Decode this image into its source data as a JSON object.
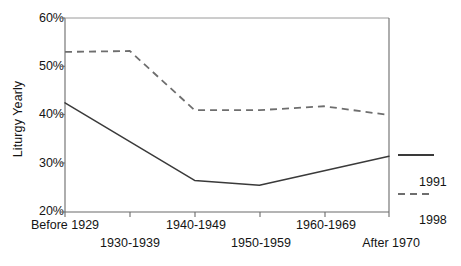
{
  "chart_data": {
    "type": "line",
    "title": "",
    "xlabel": "",
    "ylabel": "Liturgy Yearly",
    "categories": [
      "Before 1929",
      "1930-1939",
      "1940-1949",
      "1950-1959",
      "1960-1969",
      "After 1970"
    ],
    "series": [
      {
        "name": "1991",
        "style": "solid",
        "values": [
          42.5,
          34.5,
          26.5,
          25.5,
          28.5,
          31.5
        ]
      },
      {
        "name": "1998",
        "style": "dashed",
        "values": [
          53.0,
          53.2,
          41.0,
          41.0,
          41.8,
          40.0
        ]
      }
    ],
    "ylim": [
      20,
      60
    ],
    "yticks": [
      20,
      30,
      40,
      50,
      60
    ],
    "ytick_labels": [
      "20%",
      "30%",
      "40%",
      "50%",
      "60%"
    ],
    "grid": false,
    "legend_position": "right",
    "line_color": "#3a3a3a"
  },
  "axes": {
    "y_axis_title": "Liturgy Yearly",
    "y_tick_labels": [
      "60%",
      "50%",
      "40%",
      "30%",
      "20%"
    ],
    "x_tick_labels": [
      "Before 1929",
      "1930-1939",
      "1940-1949",
      "1950-1959",
      "1960-1969",
      "After 1970"
    ]
  },
  "legend": {
    "entries": [
      {
        "label": "1991",
        "style": "solid"
      },
      {
        "label": "1998",
        "style": "dashed"
      }
    ]
  }
}
